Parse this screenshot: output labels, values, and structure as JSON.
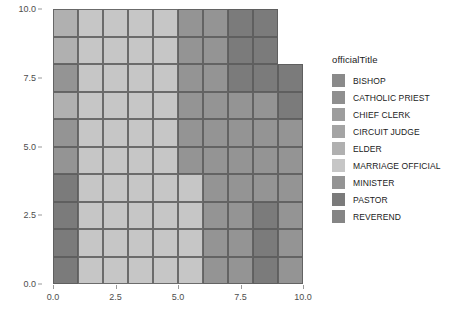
{
  "chart_data": {
    "type": "heatmap",
    "title": "",
    "xlabel": "",
    "ylabel": "",
    "xlim": [
      0.0,
      10.0
    ],
    "ylim": [
      0.0,
      10.0
    ],
    "grid": false,
    "legend_position": "right",
    "legend_title": "officialTitle",
    "x_ticks": [
      "0.0",
      "2.5",
      "5.0",
      "7.5",
      "10.0"
    ],
    "x_tick_values": [
      0.0,
      2.5,
      5.0,
      7.5,
      10.0
    ],
    "y_ticks": [
      "0.0",
      "2.5",
      "5.0",
      "7.5",
      "10.0"
    ],
    "y_tick_values": [
      0.0,
      2.5,
      5.0,
      7.5,
      10.0
    ],
    "categories": [
      "BISHOP",
      "CATHOLIC PRIEST",
      "CHIEF CLERK",
      "CIRCUIT JUDGE",
      "ELDER",
      "MARRIAGE OFFICIAL",
      "MINISTER",
      "PASTOR",
      "REVEREND"
    ],
    "category_colors": [
      "#8a8a8a",
      "#8f8f8f",
      "#9d9d9d",
      "#a4a4a4",
      "#b0b0b0",
      "#c6c6c6",
      "#949494",
      "#7b7b7b",
      "#858585"
    ],
    "cell_size": 1,
    "x_bins": [
      1,
      2,
      3,
      4,
      5,
      6,
      7,
      8,
      9,
      10
    ],
    "y_bins": [
      1,
      2,
      3,
      4,
      5,
      6,
      7,
      8,
      9,
      10
    ],
    "cells": [
      {
        "x": 1,
        "y": 10,
        "category": "ELDER",
        "color": "#b0b0b0"
      },
      {
        "x": 2,
        "y": 10,
        "category": "MARRIAGE OFFICIAL",
        "color": "#c6c6c6"
      },
      {
        "x": 3,
        "y": 10,
        "category": "MARRIAGE OFFICIAL",
        "color": "#c6c6c6"
      },
      {
        "x": 4,
        "y": 10,
        "category": "MARRIAGE OFFICIAL",
        "color": "#c6c6c6"
      },
      {
        "x": 5,
        "y": 10,
        "category": "MARRIAGE OFFICIAL",
        "color": "#c6c6c6"
      },
      {
        "x": 6,
        "y": 10,
        "category": "MINISTER",
        "color": "#949494"
      },
      {
        "x": 7,
        "y": 10,
        "category": "MINISTER",
        "color": "#949494"
      },
      {
        "x": 8,
        "y": 10,
        "category": "PASTOR",
        "color": "#7b7b7b"
      },
      {
        "x": 9,
        "y": 10,
        "category": "PASTOR",
        "color": "#7b7b7b"
      },
      {
        "x": 1,
        "y": 9,
        "category": "ELDER",
        "color": "#b0b0b0"
      },
      {
        "x": 2,
        "y": 9,
        "category": "MARRIAGE OFFICIAL",
        "color": "#c6c6c6"
      },
      {
        "x": 3,
        "y": 9,
        "category": "MARRIAGE OFFICIAL",
        "color": "#c6c6c6"
      },
      {
        "x": 4,
        "y": 9,
        "category": "MARRIAGE OFFICIAL",
        "color": "#c6c6c6"
      },
      {
        "x": 5,
        "y": 9,
        "category": "MARRIAGE OFFICIAL",
        "color": "#c6c6c6"
      },
      {
        "x": 6,
        "y": 9,
        "category": "MINISTER",
        "color": "#949494"
      },
      {
        "x": 7,
        "y": 9,
        "category": "MINISTER",
        "color": "#949494"
      },
      {
        "x": 8,
        "y": 9,
        "category": "PASTOR",
        "color": "#7b7b7b"
      },
      {
        "x": 9,
        "y": 9,
        "category": "PASTOR",
        "color": "#7b7b7b"
      },
      {
        "x": 1,
        "y": 8,
        "category": "MINISTER",
        "color": "#949494"
      },
      {
        "x": 2,
        "y": 8,
        "category": "MARRIAGE OFFICIAL",
        "color": "#c6c6c6"
      },
      {
        "x": 3,
        "y": 8,
        "category": "MARRIAGE OFFICIAL",
        "color": "#c6c6c6"
      },
      {
        "x": 4,
        "y": 8,
        "category": "MARRIAGE OFFICIAL",
        "color": "#c6c6c6"
      },
      {
        "x": 5,
        "y": 8,
        "category": "MARRIAGE OFFICIAL",
        "color": "#c6c6c6"
      },
      {
        "x": 6,
        "y": 8,
        "category": "MINISTER",
        "color": "#949494"
      },
      {
        "x": 7,
        "y": 8,
        "category": "MINISTER",
        "color": "#949494"
      },
      {
        "x": 8,
        "y": 8,
        "category": "PASTOR",
        "color": "#7b7b7b"
      },
      {
        "x": 9,
        "y": 8,
        "category": "PASTOR",
        "color": "#7b7b7b"
      },
      {
        "x": 10,
        "y": 8,
        "category": "PASTOR",
        "color": "#7b7b7b"
      },
      {
        "x": 1,
        "y": 7,
        "category": "ELDER",
        "color": "#b0b0b0"
      },
      {
        "x": 2,
        "y": 7,
        "category": "MARRIAGE OFFICIAL",
        "color": "#c6c6c6"
      },
      {
        "x": 3,
        "y": 7,
        "category": "MARRIAGE OFFICIAL",
        "color": "#c6c6c6"
      },
      {
        "x": 4,
        "y": 7,
        "category": "MARRIAGE OFFICIAL",
        "color": "#c6c6c6"
      },
      {
        "x": 5,
        "y": 7,
        "category": "MARRIAGE OFFICIAL",
        "color": "#c6c6c6"
      },
      {
        "x": 6,
        "y": 7,
        "category": "MINISTER",
        "color": "#949494"
      },
      {
        "x": 7,
        "y": 7,
        "category": "MINISTER",
        "color": "#949494"
      },
      {
        "x": 8,
        "y": 7,
        "category": "MINISTER",
        "color": "#949494"
      },
      {
        "x": 9,
        "y": 7,
        "category": "MINISTER",
        "color": "#949494"
      },
      {
        "x": 10,
        "y": 7,
        "category": "PASTOR",
        "color": "#7b7b7b"
      },
      {
        "x": 1,
        "y": 6,
        "category": "MINISTER",
        "color": "#949494"
      },
      {
        "x": 2,
        "y": 6,
        "category": "MARRIAGE OFFICIAL",
        "color": "#c6c6c6"
      },
      {
        "x": 3,
        "y": 6,
        "category": "MARRIAGE OFFICIAL",
        "color": "#c6c6c6"
      },
      {
        "x": 4,
        "y": 6,
        "category": "MARRIAGE OFFICIAL",
        "color": "#c6c6c6"
      },
      {
        "x": 5,
        "y": 6,
        "category": "MARRIAGE OFFICIAL",
        "color": "#c6c6c6"
      },
      {
        "x": 6,
        "y": 6,
        "category": "MINISTER",
        "color": "#949494"
      },
      {
        "x": 7,
        "y": 6,
        "category": "MINISTER",
        "color": "#949494"
      },
      {
        "x": 8,
        "y": 6,
        "category": "MINISTER",
        "color": "#949494"
      },
      {
        "x": 9,
        "y": 6,
        "category": "MINISTER",
        "color": "#949494"
      },
      {
        "x": 10,
        "y": 6,
        "category": "MINISTER",
        "color": "#949494"
      },
      {
        "x": 1,
        "y": 5,
        "category": "MINISTER",
        "color": "#949494"
      },
      {
        "x": 2,
        "y": 5,
        "category": "MARRIAGE OFFICIAL",
        "color": "#c6c6c6"
      },
      {
        "x": 3,
        "y": 5,
        "category": "MARRIAGE OFFICIAL",
        "color": "#c6c6c6"
      },
      {
        "x": 4,
        "y": 5,
        "category": "MARRIAGE OFFICIAL",
        "color": "#c6c6c6"
      },
      {
        "x": 5,
        "y": 5,
        "category": "MARRIAGE OFFICIAL",
        "color": "#c6c6c6"
      },
      {
        "x": 6,
        "y": 5,
        "category": "MINISTER",
        "color": "#949494"
      },
      {
        "x": 7,
        "y": 5,
        "category": "MINISTER",
        "color": "#949494"
      },
      {
        "x": 8,
        "y": 5,
        "category": "MINISTER",
        "color": "#949494"
      },
      {
        "x": 9,
        "y": 5,
        "category": "MINISTER",
        "color": "#949494"
      },
      {
        "x": 10,
        "y": 5,
        "category": "MINISTER",
        "color": "#949494"
      },
      {
        "x": 1,
        "y": 4,
        "category": "PASTOR",
        "color": "#7b7b7b"
      },
      {
        "x": 2,
        "y": 4,
        "category": "MARRIAGE OFFICIAL",
        "color": "#c6c6c6"
      },
      {
        "x": 3,
        "y": 4,
        "category": "MARRIAGE OFFICIAL",
        "color": "#c6c6c6"
      },
      {
        "x": 4,
        "y": 4,
        "category": "MARRIAGE OFFICIAL",
        "color": "#c6c6c6"
      },
      {
        "x": 5,
        "y": 4,
        "category": "MARRIAGE OFFICIAL",
        "color": "#c6c6c6"
      },
      {
        "x": 6,
        "y": 4,
        "category": "MARRIAGE OFFICIAL",
        "color": "#c6c6c6"
      },
      {
        "x": 7,
        "y": 4,
        "category": "MINISTER",
        "color": "#949494"
      },
      {
        "x": 8,
        "y": 4,
        "category": "MINISTER",
        "color": "#949494"
      },
      {
        "x": 9,
        "y": 4,
        "category": "MINISTER",
        "color": "#949494"
      },
      {
        "x": 10,
        "y": 4,
        "category": "MINISTER",
        "color": "#949494"
      },
      {
        "x": 1,
        "y": 3,
        "category": "PASTOR",
        "color": "#7b7b7b"
      },
      {
        "x": 2,
        "y": 3,
        "category": "MARRIAGE OFFICIAL",
        "color": "#c6c6c6"
      },
      {
        "x": 3,
        "y": 3,
        "category": "MARRIAGE OFFICIAL",
        "color": "#c6c6c6"
      },
      {
        "x": 4,
        "y": 3,
        "category": "MARRIAGE OFFICIAL",
        "color": "#c6c6c6"
      },
      {
        "x": 5,
        "y": 3,
        "category": "MARRIAGE OFFICIAL",
        "color": "#c6c6c6"
      },
      {
        "x": 6,
        "y": 3,
        "category": "MARRIAGE OFFICIAL",
        "color": "#c6c6c6"
      },
      {
        "x": 7,
        "y": 3,
        "category": "MINISTER",
        "color": "#949494"
      },
      {
        "x": 8,
        "y": 3,
        "category": "MINISTER",
        "color": "#949494"
      },
      {
        "x": 9,
        "y": 3,
        "category": "PASTOR",
        "color": "#7b7b7b"
      },
      {
        "x": 10,
        "y": 3,
        "category": "MINISTER",
        "color": "#949494"
      },
      {
        "x": 1,
        "y": 2,
        "category": "PASTOR",
        "color": "#7b7b7b"
      },
      {
        "x": 2,
        "y": 2,
        "category": "MARRIAGE OFFICIAL",
        "color": "#c6c6c6"
      },
      {
        "x": 3,
        "y": 2,
        "category": "MARRIAGE OFFICIAL",
        "color": "#c6c6c6"
      },
      {
        "x": 4,
        "y": 2,
        "category": "MARRIAGE OFFICIAL",
        "color": "#c6c6c6"
      },
      {
        "x": 5,
        "y": 2,
        "category": "MARRIAGE OFFICIAL",
        "color": "#c6c6c6"
      },
      {
        "x": 6,
        "y": 2,
        "category": "MARRIAGE OFFICIAL",
        "color": "#c6c6c6"
      },
      {
        "x": 7,
        "y": 2,
        "category": "MINISTER",
        "color": "#949494"
      },
      {
        "x": 8,
        "y": 2,
        "category": "MINISTER",
        "color": "#949494"
      },
      {
        "x": 9,
        "y": 2,
        "category": "PASTOR",
        "color": "#7b7b7b"
      },
      {
        "x": 10,
        "y": 2,
        "category": "MINISTER",
        "color": "#949494"
      },
      {
        "x": 1,
        "y": 1,
        "category": "PASTOR",
        "color": "#7b7b7b"
      },
      {
        "x": 2,
        "y": 1,
        "category": "MARRIAGE OFFICIAL",
        "color": "#c6c6c6"
      },
      {
        "x": 3,
        "y": 1,
        "category": "MARRIAGE OFFICIAL",
        "color": "#c6c6c6"
      },
      {
        "x": 4,
        "y": 1,
        "category": "MARRIAGE OFFICIAL",
        "color": "#c6c6c6"
      },
      {
        "x": 5,
        "y": 1,
        "category": "MARRIAGE OFFICIAL",
        "color": "#c6c6c6"
      },
      {
        "x": 6,
        "y": 1,
        "category": "MARRIAGE OFFICIAL",
        "color": "#c6c6c6"
      },
      {
        "x": 7,
        "y": 1,
        "category": "MINISTER",
        "color": "#949494"
      },
      {
        "x": 8,
        "y": 1,
        "category": "MINISTER",
        "color": "#949494"
      },
      {
        "x": 9,
        "y": 1,
        "category": "PASTOR",
        "color": "#7b7b7b"
      },
      {
        "x": 10,
        "y": 1,
        "category": "MINISTER",
        "color": "#949494"
      }
    ]
  },
  "legend": {
    "title": "officialTitle",
    "items": [
      {
        "label": "BISHOP",
        "color": "#8a8a8a"
      },
      {
        "label": "CATHOLIC PRIEST",
        "color": "#8f8f8f"
      },
      {
        "label": "CHIEF CLERK",
        "color": "#9d9d9d"
      },
      {
        "label": "CIRCUIT JUDGE",
        "color": "#a4a4a4"
      },
      {
        "label": "ELDER",
        "color": "#b0b0b0"
      },
      {
        "label": "MARRIAGE OFFICIAL",
        "color": "#c6c6c6"
      },
      {
        "label": "MINISTER",
        "color": "#949494"
      },
      {
        "label": "PASTOR",
        "color": "#7b7b7b"
      },
      {
        "label": "REVEREND",
        "color": "#858585"
      }
    ]
  },
  "theme": {
    "background": "#ffffff",
    "tick_label_color": "#4d4d4d",
    "tile_border_color": "#5a5a5a"
  }
}
